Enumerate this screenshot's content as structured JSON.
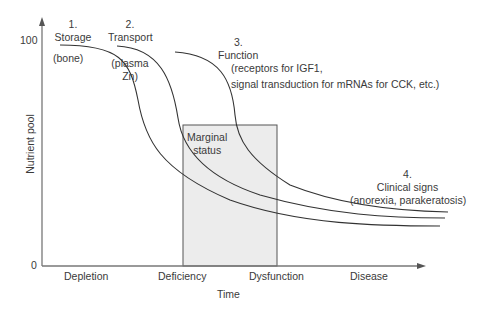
{
  "diagram": {
    "y_axis": {
      "label": "Nutrient pool",
      "ticks": [
        "100",
        "0"
      ]
    },
    "x_axis": {
      "label": "Time",
      "stages": [
        "Depletion",
        "Deficiency",
        "Dysfunction",
        "Disease"
      ]
    },
    "box": {
      "label_line1": "Marginal",
      "label_line2": "status",
      "fill": "#ececec"
    },
    "annotations": {
      "a1": {
        "num": "1.",
        "title": "Storage",
        "detail": "(bone)"
      },
      "a2": {
        "num": "2.",
        "title": "Transport",
        "detail1": "(plasma",
        "detail2": "Zn)"
      },
      "a3": {
        "num": "3.",
        "title": "Function",
        "detail1": "(receptors for IGF1,",
        "detail2": "signal transduction for mRNAs for CCK, etc.)"
      },
      "a4": {
        "num": "4.",
        "title": "Clinical signs",
        "detail": "(anorexia, parakeratosis)"
      }
    }
  }
}
